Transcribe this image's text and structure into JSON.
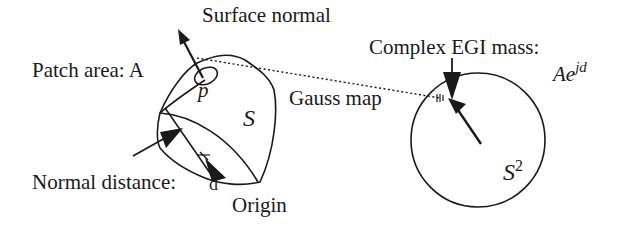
{
  "diagram": {
    "colors": {
      "ink": "#1a1a1a",
      "background": "#ffffff"
    },
    "labels": {
      "surface_normal": "Surface normal",
      "patch_area": "Patch area: A",
      "patch_point": "p",
      "surface_name": "S",
      "gauss_map": "Gauss map",
      "normal_distance": "Normal distance: d",
      "origin": "Origin",
      "complex_egi_mass": "Complex EGI mass:",
      "egi_mass_base": "Ae",
      "egi_mass_exponent": "jd",
      "sphere_base": "S",
      "sphere_exponent": "2"
    },
    "nodes": [
      {
        "id": "surface",
        "label": "S",
        "shape": "closed-blob"
      },
      {
        "id": "patch",
        "label": "p",
        "shape": "small-ellipse"
      },
      {
        "id": "origin",
        "label": "Origin",
        "shape": "point"
      },
      {
        "id": "sphere",
        "label": "S^2",
        "shape": "circle"
      }
    ],
    "edges": [
      {
        "from": "patch",
        "to": "sphere",
        "label": "Gauss map",
        "style": "dotted"
      },
      {
        "from": "patch",
        "to": "surface-normal",
        "label": "Surface normal",
        "style": "arrow"
      },
      {
        "from": "origin",
        "to": "surface",
        "label": "Normal distance: d",
        "style": "arrow"
      },
      {
        "from": "sphere-center",
        "to": "sphere-surface",
        "style": "arrow"
      }
    ]
  }
}
